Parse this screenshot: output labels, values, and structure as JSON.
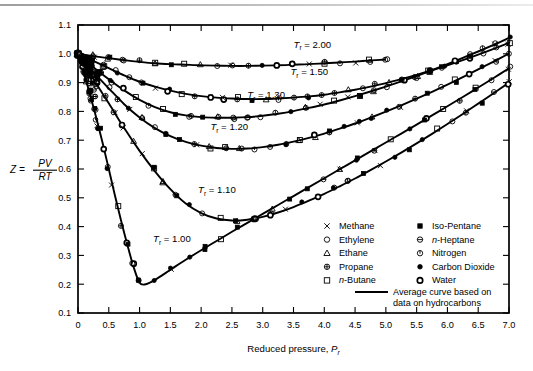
{
  "figure": {
    "y_axis_label_parts": {
      "z": "Z",
      "equals": "=",
      "numerator": "PV",
      "denominator": "RT"
    },
    "x_axis_title": "Reduced pressure, ",
    "x_axis_title_symbol": "P",
    "x_axis_title_subscript": "r"
  },
  "legend": {
    "column_left": [
      {
        "marker": "cross-x-marker",
        "label": "Methane"
      },
      {
        "marker": "open-circle-marker",
        "label": "Ethylene"
      },
      {
        "marker": "open-triangle-marker",
        "label": "Ethane"
      },
      {
        "marker": "circled-plus-marker",
        "label": "Propane"
      },
      {
        "marker": "open-square-marker",
        "label": "n-Butane",
        "italic_prefix": "n",
        "rest": "-Butane"
      }
    ],
    "column_right": [
      {
        "marker": "filled-square-marker",
        "label": "Iso-Pentane"
      },
      {
        "marker": "circled-dash-marker",
        "label": "n-Heptane",
        "italic_prefix": "n",
        "rest": "-Heptane"
      },
      {
        "marker": "open-circle-dot-marker",
        "label": "Nitrogen"
      },
      {
        "marker": "filled-circle-marker",
        "label": "Carbon Dioxide"
      },
      {
        "marker": "bold-circle-marker",
        "label": "Water"
      }
    ],
    "average_curve_line1": "Average curve based on",
    "average_curve_line2": "data on hydrocarbons"
  },
  "chart_data": {
    "type": "line",
    "title": "",
    "xlabel": "Reduced pressure, Pr",
    "ylabel": "Z = PV/RT",
    "xlim": [
      0,
      7.0
    ],
    "ylim": [
      0.1,
      1.1
    ],
    "grid": false,
    "legend_position": "lower-right-inside",
    "xticks": [
      "0",
      "0.5",
      "1.0",
      "1.5",
      "2.0",
      "2.5",
      "3.0",
      "3.5",
      "4.0",
      "4.5",
      "5.0",
      "5.5",
      "6.0",
      "6.5",
      "7.0"
    ],
    "yticks": [
      "0.1",
      "0.2",
      "0.3",
      "0.4",
      "0.5",
      "0.6",
      "0.7",
      "0.8",
      "0.9",
      "1.0",
      "1.1"
    ],
    "annotations": [
      {
        "text": "Tr = 2.00",
        "symbol": "T",
        "subscript": "r",
        "value": "2.00",
        "x": 3.5,
        "y": 1.02
      },
      {
        "text": "Tr = 1.50",
        "symbol": "T",
        "subscript": "r",
        "value": "1.50",
        "x": 3.45,
        "y": 0.925
      },
      {
        "text": "Tr = 1.30",
        "symbol": "T",
        "subscript": "r",
        "value": "1.30",
        "x": 2.75,
        "y": 0.845
      },
      {
        "text": "Tr = 1.20",
        "symbol": "T",
        "subscript": "r",
        "value": "1.20",
        "x": 2.15,
        "y": 0.735
      },
      {
        "text": "Tr = 1.10",
        "symbol": "T",
        "subscript": "r",
        "value": "1.10",
        "x": 1.95,
        "y": 0.515
      },
      {
        "text": "Tr = 1.00",
        "symbol": "T",
        "subscript": "r",
        "value": "1.00",
        "x": 1.22,
        "y": 0.345
      }
    ],
    "series": [
      {
        "name": "Tr = 2.00",
        "x": [
          0.0,
          0.15,
          0.3,
          0.5,
          0.75,
          1.0,
          1.25,
          1.5,
          1.75,
          2.0,
          2.25,
          2.5,
          2.75,
          3.0,
          3.25,
          3.5,
          3.75,
          4.0,
          4.25,
          4.5,
          4.75,
          5.0
        ],
        "values": [
          1.0,
          0.995,
          0.99,
          0.985,
          0.978,
          0.972,
          0.967,
          0.964,
          0.962,
          0.96,
          0.959,
          0.958,
          0.958,
          0.959,
          0.96,
          0.962,
          0.964,
          0.967,
          0.97,
          0.973,
          0.977,
          0.98
        ]
      },
      {
        "name": "Tr = 1.50",
        "x": [
          0.0,
          0.15,
          0.3,
          0.5,
          0.75,
          1.0,
          1.25,
          1.5,
          1.75,
          2.0,
          2.25,
          2.5,
          2.75,
          3.0,
          3.25,
          3.5,
          3.75,
          4.0,
          4.25,
          4.5,
          4.75,
          5.0,
          5.25,
          5.5,
          5.75,
          6.0,
          6.25,
          6.5,
          6.75,
          7.0
        ],
        "values": [
          1.0,
          0.985,
          0.97,
          0.95,
          0.925,
          0.903,
          0.886,
          0.872,
          0.861,
          0.853,
          0.848,
          0.845,
          0.843,
          0.843,
          0.845,
          0.848,
          0.852,
          0.858,
          0.866,
          0.875,
          0.886,
          0.898,
          0.912,
          0.927,
          0.943,
          0.96,
          0.978,
          0.997,
          1.017,
          1.038
        ]
      },
      {
        "name": "Tr = 1.30",
        "x": [
          0.0,
          0.15,
          0.3,
          0.5,
          0.75,
          1.0,
          1.25,
          1.5,
          1.75,
          2.0,
          2.25,
          2.5,
          2.75,
          3.0,
          3.25,
          3.5,
          3.75,
          4.0,
          4.25,
          4.5,
          4.75,
          5.0,
          5.25,
          5.5,
          5.75,
          6.0,
          6.25,
          6.5,
          6.75,
          7.0
        ],
        "values": [
          1.0,
          0.972,
          0.945,
          0.912,
          0.873,
          0.84,
          0.815,
          0.797,
          0.786,
          0.78,
          0.778,
          0.778,
          0.78,
          0.785,
          0.792,
          0.801,
          0.812,
          0.824,
          0.838,
          0.853,
          0.869,
          0.886,
          0.904,
          0.923,
          0.943,
          0.964,
          0.986,
          1.008,
          1.031,
          1.055
        ]
      },
      {
        "name": "Tr = 1.20",
        "x": [
          0.0,
          0.15,
          0.3,
          0.5,
          0.75,
          1.0,
          1.25,
          1.5,
          1.75,
          2.0,
          2.25,
          2.5,
          2.75,
          3.0,
          3.25,
          3.5,
          3.75,
          4.0,
          4.25,
          4.5,
          4.75,
          5.0,
          5.25,
          5.5,
          5.75,
          6.0,
          6.25,
          6.5,
          6.75,
          7.0
        ],
        "values": [
          1.0,
          0.962,
          0.925,
          0.88,
          0.825,
          0.779,
          0.742,
          0.714,
          0.694,
          0.681,
          0.673,
          0.67,
          0.671,
          0.676,
          0.684,
          0.695,
          0.708,
          0.723,
          0.74,
          0.758,
          0.778,
          0.799,
          0.821,
          0.844,
          0.868,
          0.893,
          0.919,
          0.946,
          0.973,
          1.001
        ]
      },
      {
        "name": "Tr = 1.10",
        "x": [
          0.0,
          0.15,
          0.3,
          0.5,
          0.75,
          1.0,
          1.25,
          1.5,
          1.75,
          2.0,
          2.25,
          2.5,
          2.75,
          3.0,
          3.25,
          3.5,
          3.75,
          4.0,
          4.25,
          4.5,
          4.75,
          5.0,
          5.25,
          5.5,
          5.75,
          6.0,
          6.25,
          6.5,
          6.75,
          7.0
        ],
        "values": [
          1.0,
          0.948,
          0.895,
          0.828,
          0.742,
          0.663,
          0.592,
          0.53,
          0.48,
          0.447,
          0.428,
          0.421,
          0.424,
          0.434,
          0.449,
          0.468,
          0.49,
          0.514,
          0.54,
          0.567,
          0.596,
          0.626,
          0.657,
          0.689,
          0.722,
          0.756,
          0.791,
          0.827,
          0.863,
          0.9
        ]
      },
      {
        "name": "Tr = 1.00",
        "x": [
          0.0,
          0.1,
          0.2,
          0.3,
          0.4,
          0.5,
          0.6,
          0.7,
          0.8,
          0.9,
          1.0,
          1.1,
          1.25,
          1.5,
          1.75,
          2.0,
          2.25,
          2.5,
          2.75,
          3.0,
          3.25,
          3.5,
          3.75,
          4.0,
          4.25,
          4.5,
          4.75,
          5.0,
          5.25,
          5.5,
          5.75,
          6.0,
          6.25,
          6.5,
          6.75,
          7.0
        ],
        "values": [
          1.0,
          0.93,
          0.855,
          0.775,
          0.69,
          0.6,
          0.508,
          0.42,
          0.338,
          0.262,
          0.205,
          0.2,
          0.215,
          0.25,
          0.285,
          0.318,
          0.35,
          0.382,
          0.413,
          0.444,
          0.475,
          0.506,
          0.537,
          0.568,
          0.599,
          0.63,
          0.661,
          0.692,
          0.723,
          0.754,
          0.786,
          0.818,
          0.85,
          0.883,
          0.916,
          0.95
        ]
      }
    ]
  }
}
